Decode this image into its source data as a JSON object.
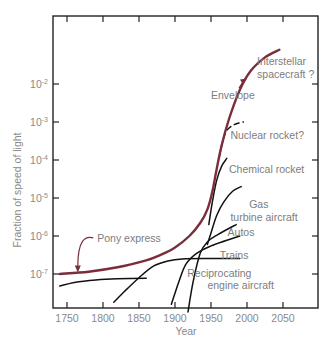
{
  "chart_data": {
    "type": "line",
    "title": "",
    "xlabel": "Year",
    "ylabel": "Fraction of speed of light",
    "xscale": "linear",
    "yscale": "log",
    "xlim": [
      1730,
      2098
    ],
    "ylim": [
      1e-08,
      1
    ],
    "x_ticks": [
      1750,
      1800,
      1850,
      1900,
      1950,
      2000,
      2050
    ],
    "x_tick_labels": [
      "1750",
      "1800",
      "1850",
      "1900",
      "1950",
      "2000",
      "2050"
    ],
    "y_ticks": [
      -7,
      -6,
      -5,
      -4,
      -3,
      -2
    ],
    "y_tick_labels": [
      {
        "base": "10",
        "exp": "-7"
      },
      {
        "base": "10",
        "exp": "-6"
      },
      {
        "base": "10",
        "exp": "-5"
      },
      {
        "base": "10",
        "exp": "-4"
      },
      {
        "base": "10",
        "exp": "-3"
      },
      {
        "base": "10",
        "exp": "-2"
      }
    ],
    "grid": false,
    "legend": "none (direct annotations)",
    "series": [
      {
        "name": "Envelope",
        "color": "#7a2e3c",
        "style": "solid",
        "width": 2.4,
        "x": [
          1740,
          1780,
          1820,
          1860,
          1880,
          1900,
          1920,
          1935,
          1945,
          1952,
          1958,
          1965,
          1975,
          1990,
          2005,
          2025,
          2045
        ],
        "y": [
          1e-07,
          1.15e-07,
          1.5e-07,
          2.3e-07,
          3.2e-07,
          5e-07,
          1e-06,
          2.2e-06,
          5e-06,
          1.5e-05,
          6e-05,
          0.00025,
          0.0012,
          0.007,
          0.022,
          0.05,
          0.08
        ]
      },
      {
        "name": "Pony express",
        "color": "#111111",
        "style": "solid",
        "width": 1.5,
        "x": [
          1740,
          1760,
          1790,
          1820,
          1860
        ],
        "y": [
          4.8e-08,
          6e-08,
          7e-08,
          7.5e-08,
          7.7e-08
        ]
      },
      {
        "name": "Trains",
        "color": "#111111",
        "style": "solid",
        "width": 1.5,
        "x": [
          1815,
          1830,
          1850,
          1870,
          1890,
          1910,
          1950,
          1990
        ],
        "y": [
          1.8e-08,
          3.5e-08,
          8e-08,
          1.6e-07,
          2.2e-07,
          2.5e-07,
          2.55e-07,
          2.55e-07
        ]
      },
      {
        "name": "Autos",
        "color": "#111111",
        "style": "solid",
        "width": 1.5,
        "x": [
          1895,
          1905,
          1915,
          1930,
          1950,
          1970,
          1990
        ],
        "y": [
          1.6e-08,
          6e-08,
          1.8e-07,
          3.5e-07,
          5.5e-07,
          7.5e-07,
          1e-06
        ]
      },
      {
        "name": "Reciprocating engine aircraft",
        "color": "#111111",
        "style": "solid",
        "width": 1.5,
        "x": [
          1918,
          1925,
          1935,
          1945,
          1960,
          1985
        ],
        "y": [
          1e-08,
          6e-08,
          3.5e-07,
          7e-07,
          1.1e-06,
          2e-06
        ]
      },
      {
        "name": "Gas turbine aircraft",
        "color": "#111111",
        "style": "solid",
        "width": 1.5,
        "x": [
          1945,
          1950,
          1958,
          1968,
          1980,
          1992
        ],
        "y": [
          6e-07,
          1.2e-06,
          3.5e-06,
          8e-06,
          1.5e-05,
          2e-05
        ]
      },
      {
        "name": "Chemical rocket",
        "color": "#111111",
        "style": "solid",
        "width": 1.5,
        "x": [
          1947,
          1952,
          1958,
          1965,
          1972
        ],
        "y": [
          2e-06,
          8e-06,
          3e-05,
          7e-05,
          0.00011
        ]
      },
      {
        "name": "Nuclear rocket?",
        "color": "#111111",
        "style": "dashed",
        "width": 1.5,
        "x": [
          1962,
          1966,
          1972,
          1982,
          1995
        ],
        "y": [
          0.00013,
          0.0003,
          0.0006,
          0.00085,
          0.001
        ]
      }
    ],
    "annotations": [
      {
        "text": "Interstellar",
        "x": 2014,
        "y": 0.032
      },
      {
        "text": "spacecraft ?",
        "x": 2014,
        "y": 0.014
      },
      {
        "text": "Envelope",
        "x": 1950,
        "y": 0.004,
        "arrow_to": [
          2000,
          0.014
        ]
      },
      {
        "text": "Nuclear rocket?",
        "x": 1977,
        "y": 0.00035
      },
      {
        "text": "Chemical rocket",
        "x": 1975,
        "y": 4.5e-05
      },
      {
        "text": "Gas",
        "x": 2003,
        "y": 5.5e-06
      },
      {
        "text": "turbine aircraft",
        "x": 1977,
        "y": 2.5e-06
      },
      {
        "text": "Autos",
        "x": 1973,
        "y": 1e-06
      },
      {
        "text": "Trains",
        "x": 1962,
        "y": 2.5e-07
      },
      {
        "text": "Reciprocating",
        "x": 1917,
        "y": 8.5e-08
      },
      {
        "text": "engine aircraft",
        "x": 1945,
        "y": 4e-08
      },
      {
        "text": "Pony express",
        "x": 1792,
        "y": 7e-07,
        "arrow_to": [
          1765,
          1.1e-07
        ]
      }
    ]
  },
  "colors": {
    "envelope": "#7a2e3c",
    "curves": "#111111",
    "axis": "#222222",
    "text": "#8a8a8a"
  }
}
